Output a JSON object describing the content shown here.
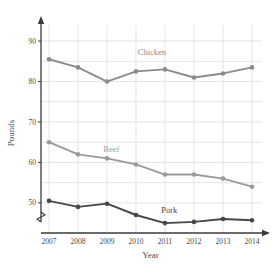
{
  "chart_data": {
    "type": "line",
    "title": "",
    "xlabel": "Year",
    "ylabel": "Pounds",
    "categories": [
      "2007",
      "2008",
      "2009",
      "2010",
      "2011",
      "2012",
      "2013",
      "2014"
    ],
    "x": [
      2007,
      2008,
      2009,
      2010,
      2011,
      2012,
      2013,
      2014
    ],
    "ylim": [
      47,
      92
    ],
    "y_ticks": [
      50,
      60,
      70,
      80,
      90
    ],
    "y_tick_labels": [
      "50",
      "60",
      "70",
      "80",
      "90"
    ],
    "y_minor_ticks": [
      55,
      65,
      75,
      85
    ],
    "grid": true,
    "grid_color": "#d8d8d8",
    "axis_break": true,
    "legend": "inline-labels",
    "series": [
      {
        "name": "Chicken",
        "color": "#8c8c8c",
        "label_x": 2010.55,
        "label_y": 86.6,
        "values": [
          85.5,
          83.5,
          80.0,
          82.5,
          83.0,
          81.0,
          82.0,
          83.5
        ]
      },
      {
        "name": "Beef",
        "color": "#9a9a9a",
        "label_x": 2009.15,
        "label_y": 62.6,
        "values": [
          65.0,
          62.0,
          61.0,
          59.5,
          57.0,
          57.0,
          56.0,
          54.0
        ]
      },
      {
        "name": "Pork",
        "color": "#474747",
        "label_x": 2011.15,
        "label_y": 47.6,
        "values": [
          50.5,
          49.0,
          49.8,
          47.0,
          45.0,
          45.3,
          46.0,
          45.7
        ]
      }
    ]
  },
  "axes": {
    "x_axis_label": "Year",
    "y_axis_label": "Pounds"
  }
}
